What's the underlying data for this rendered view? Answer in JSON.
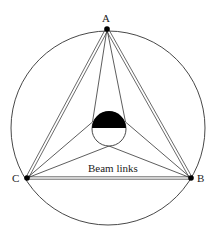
{
  "diagram": {
    "type": "geometric-diagram",
    "caption": "Beam links",
    "colors": {
      "stroke": "#333333",
      "fill_dark": "#000000",
      "background": "#ffffff"
    },
    "nodes": [
      {
        "id": "A",
        "label": "A",
        "x": 107,
        "y": 29
      },
      {
        "id": "B",
        "label": "B",
        "x": 191,
        "y": 178
      },
      {
        "id": "C",
        "label": "C",
        "x": 27,
        "y": 178
      }
    ],
    "outer_circle": {
      "cx": 108,
      "cy": 128,
      "r": 97
    },
    "inner_circle": {
      "cx": 109,
      "cy": 129,
      "r": 17,
      "top_half_filled": true
    },
    "edges": [
      {
        "from": "A",
        "to": "B",
        "style": "double"
      },
      {
        "from": "A",
        "to": "C",
        "style": "double"
      },
      {
        "from": "B",
        "to": "C",
        "style": "double"
      }
    ]
  }
}
